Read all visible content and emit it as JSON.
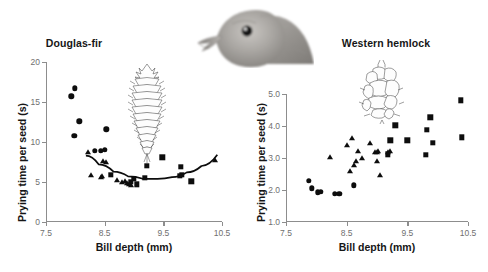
{
  "figure": {
    "bird_image_label": "crossbill-head-photo",
    "background": "#ffffff",
    "marker_color": "#0d0d0d",
    "axis_color": "#8d8d8d"
  },
  "chart_data": [
    {
      "type": "scatter",
      "panel": "left",
      "title": "Douglas-fir",
      "xlabel": "Bill depth (mm)",
      "ylabel": "Prying time per seed (s)",
      "xlim": [
        7.5,
        10.5
      ],
      "ylim": [
        0,
        20
      ],
      "xticks": [
        7.5,
        8.5,
        9.5,
        10.5
      ],
      "xticklabels": [
        "7.5",
        "8.5",
        "9.5",
        "10.5"
      ],
      "yticks": [
        0,
        5,
        10,
        15,
        20
      ],
      "yticklabels": [
        "0",
        "5",
        "10",
        "15",
        "20"
      ],
      "grid": false,
      "legend": "none",
      "illustration": "douglas-fir-cone",
      "series": [
        {
          "name": "circles",
          "marker": "circle",
          "points": [
            [
              7.93,
              15.7
            ],
            [
              7.99,
              16.7
            ],
            [
              8.07,
              12.6
            ],
            [
              7.98,
              10.8
            ],
            [
              8.53,
              11.6
            ],
            [
              8.33,
              8.9
            ],
            [
              8.43,
              8.9
            ],
            [
              8.5,
              9.0
            ]
          ]
        },
        {
          "name": "triangles",
          "marker": "triangle",
          "points": [
            [
              8.21,
              8.7
            ],
            [
              8.47,
              7.6
            ],
            [
              8.52,
              7.5
            ],
            [
              8.26,
              5.9
            ],
            [
              8.43,
              5.6
            ],
            [
              8.46,
              5.7
            ],
            [
              8.71,
              5.3
            ],
            [
              8.8,
              5.0
            ],
            [
              8.88,
              4.9
            ],
            [
              8.92,
              4.7
            ],
            [
              8.95,
              4.6
            ],
            [
              8.85,
              5.1
            ],
            [
              10.38,
              7.8
            ]
          ]
        },
        {
          "name": "squares",
          "marker": "square",
          "points": [
            [
              8.6,
              5.9
            ],
            [
              8.95,
              5.0
            ],
            [
              9.0,
              5.4
            ],
            [
              9.05,
              4.7
            ],
            [
              9.22,
              7.0
            ],
            [
              9.18,
              5.5
            ],
            [
              9.48,
              8.1
            ],
            [
              9.8,
              6.9
            ],
            [
              9.82,
              5.9
            ],
            [
              9.78,
              5.8
            ],
            [
              9.98,
              5.1
            ]
          ]
        }
      ],
      "fit_curve": {
        "type": "quadratic",
        "visible": true,
        "x_range": [
          8.18,
          10.42
        ],
        "points": [
          [
            8.18,
            8.3
          ],
          [
            8.4,
            7.2
          ],
          [
            8.65,
            6.3
          ],
          [
            8.9,
            5.7
          ],
          [
            9.15,
            5.4
          ],
          [
            9.4,
            5.4
          ],
          [
            9.65,
            5.6
          ],
          [
            9.9,
            6.2
          ],
          [
            10.15,
            7.0
          ],
          [
            10.42,
            8.4
          ]
        ]
      }
    },
    {
      "type": "scatter",
      "panel": "right",
      "title": "Western hemlock",
      "xlabel": "Bill depth (mm)",
      "ylabel": "Prying time per seed (s)",
      "xlim": [
        7.5,
        10.5
      ],
      "ylim": [
        1.0,
        5.0
      ],
      "xticks": [
        7.5,
        8.5,
        9.5,
        10.5
      ],
      "xticklabels": [
        "7.5",
        "8.5",
        "9.5",
        "10.5"
      ],
      "yticks": [
        1.0,
        2.0,
        3.0,
        4.0,
        5.0
      ],
      "yticklabels": [
        "1.0",
        "2.0",
        "3.0",
        "4.0",
        "5.0"
      ],
      "grid": false,
      "legend": "none",
      "illustration": "western-hemlock-cone",
      "series": [
        {
          "name": "circles",
          "marker": "circle",
          "points": [
            [
              7.88,
              2.28
            ],
            [
              7.93,
              2.05
            ],
            [
              8.02,
              1.93
            ],
            [
              8.07,
              1.95
            ],
            [
              8.3,
              1.88
            ],
            [
              8.38,
              1.88
            ],
            [
              8.62,
              2.15
            ]
          ]
        },
        {
          "name": "triangles",
          "marker": "triangle",
          "points": [
            [
              8.22,
              3.02
            ],
            [
              8.5,
              3.4
            ],
            [
              8.58,
              3.62
            ],
            [
              8.56,
              2.6
            ],
            [
              8.62,
              2.78
            ],
            [
              8.68,
              3.22
            ],
            [
              8.66,
              2.92
            ],
            [
              8.75,
              3.0
            ],
            [
              8.88,
              3.47
            ],
            [
              8.96,
              3.2
            ],
            [
              9.0,
              3.18
            ],
            [
              9.02,
              3.22
            ],
            [
              9.0,
              2.92
            ],
            [
              9.05,
              2.48
            ],
            [
              9.18,
              3.2
            ],
            [
              9.22,
              3.22
            ]
          ]
        },
        {
          "name": "squares",
          "marker": "square",
          "points": [
            [
              9.22,
              3.55
            ],
            [
              9.3,
              4.02
            ],
            [
              9.18,
              3.12
            ],
            [
              9.5,
              3.55
            ],
            [
              9.8,
              3.1
            ],
            [
              9.82,
              3.88
            ],
            [
              9.88,
              4.27
            ],
            [
              9.92,
              3.48
            ],
            [
              10.38,
              4.8
            ],
            [
              10.4,
              3.65
            ]
          ]
        }
      ],
      "fit_curve": {
        "visible": false
      }
    }
  ]
}
